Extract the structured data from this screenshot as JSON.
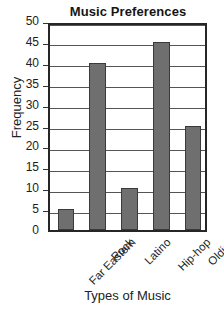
{
  "chart_data": {
    "type": "bar",
    "title": "Music Preferences",
    "xlabel": "Types of Music",
    "ylabel": "Frequency",
    "categories": [
      "Far Eastern",
      "Rock",
      "Latino",
      "Hip-hop",
      "Oldies"
    ],
    "values": [
      5,
      40,
      10,
      45,
      25
    ],
    "ylim": [
      0,
      50
    ],
    "ytick_labels": [
      "0",
      "5",
      "10",
      "15",
      "20",
      "25",
      "30",
      "35",
      "40",
      "45",
      "50"
    ],
    "ytick_values": [
      0,
      5,
      10,
      15,
      20,
      25,
      30,
      35,
      40,
      45,
      50
    ],
    "grid": true,
    "grid_axis": "y",
    "legend": false,
    "bar_color": "#6f6f6f",
    "bar_edge_color": "#3a3a3a",
    "frame_color": "#262626",
    "gridline_color": "#555555",
    "xtick_rotation": -45
  }
}
